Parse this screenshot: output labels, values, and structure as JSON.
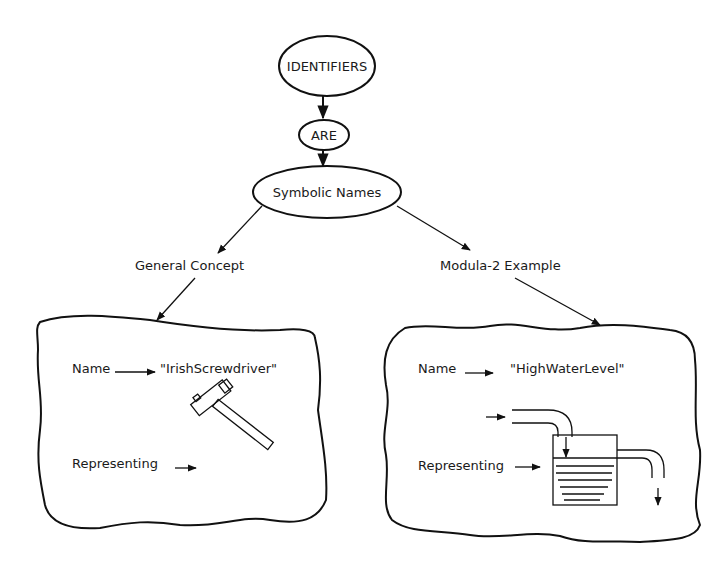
{
  "diagram": {
    "nodes": {
      "identifiers": "IDENTIFIERS",
      "are": "ARE",
      "symbolic_names": "Symbolic Names"
    },
    "branches": {
      "left": "General Concept",
      "right": "Modula-2 Example"
    },
    "left_panel": {
      "name_label": "Name",
      "name_value": "\"IrishScrewdriver\"",
      "representing_label": "Representing",
      "illustration": "hammer-icon"
    },
    "right_panel": {
      "name_label": "Name",
      "name_value": "\"HighWaterLevel\"",
      "representing_label": "Representing",
      "illustration": "water-tank-icon"
    },
    "colors": {
      "ink": "#111111",
      "background": "#ffffff"
    }
  }
}
